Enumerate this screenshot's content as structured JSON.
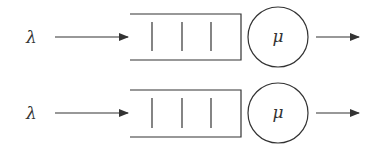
{
  "diagram": {
    "type": "queueing-system",
    "queues": [
      {
        "arrival_label": "λ",
        "service_label": "μ",
        "buffer_slots": 3
      },
      {
        "arrival_label": "λ",
        "service_label": "μ",
        "buffer_slots": 3
      }
    ]
  },
  "colors": {
    "stroke": "#333333",
    "background": "#ffffff"
  }
}
